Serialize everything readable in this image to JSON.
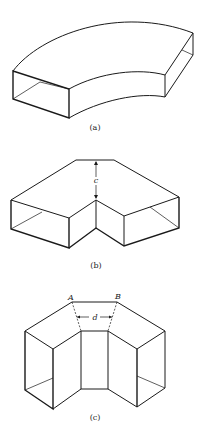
{
  "figure": {
    "panels": [
      {
        "id": "a",
        "caption": "(a)",
        "description": "Radius duct elbow (smooth curved rectangular bend)"
      },
      {
        "id": "b",
        "caption": "(b)",
        "description": "Mitered duct elbow",
        "dimension_label": "c"
      },
      {
        "id": "c",
        "caption": "(c)",
        "description": "Square-throat / segmented duct elbow",
        "point_labels": [
          "A",
          "B"
        ],
        "dimension_label": "d"
      }
    ]
  }
}
